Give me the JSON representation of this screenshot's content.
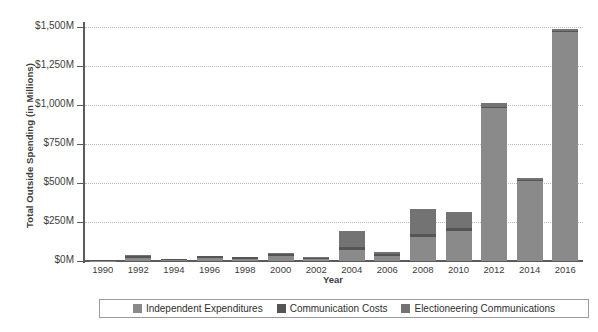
{
  "chart_data": {
    "type": "bar",
    "title": "",
    "xlabel": "Year",
    "ylabel": "Total Outside Spending (in Millions)",
    "ylim": [
      0,
      1500
    ],
    "ytick_labels": [
      "$0M",
      "$250M",
      "$500M",
      "$750M",
      "$1,000M",
      "$1,250M",
      "$1,500M"
    ],
    "ytick_values": [
      0,
      250,
      500,
      750,
      1000,
      1250,
      1500
    ],
    "grid": true,
    "stacked": true,
    "legend_position": "bottom",
    "categories": [
      "1990",
      "1992",
      "1994",
      "1996",
      "1998",
      "2000",
      "2002",
      "2004",
      "2006",
      "2008",
      "2010",
      "2012",
      "2014",
      "2016"
    ],
    "series": [
      {
        "name": "Independent Expenditures",
        "color": "#8a8a8a",
        "values": [
          3,
          20,
          6,
          18,
          14,
          30,
          13,
          68,
          32,
          152,
          193,
          980,
          510,
          1470
        ]
      },
      {
        "name": "Communication Costs",
        "color": "#555555",
        "values": [
          2,
          13,
          6,
          12,
          9,
          17,
          9,
          22,
          10,
          24,
          20,
          8,
          8,
          6
        ]
      },
      {
        "name": "Electioneering Communications",
        "color": "#737373",
        "values": [
          0,
          5,
          2,
          3,
          2,
          5,
          3,
          102,
          18,
          155,
          102,
          24,
          16,
          14
        ]
      }
    ],
    "totals": [
      5,
      38,
      14,
      33,
      25,
      52,
      25,
      192,
      60,
      331,
      315,
      1012,
      534,
      1490
    ]
  },
  "legend": {
    "items": [
      {
        "label": "Independent Expenditures",
        "color": "#8a8a8a"
      },
      {
        "label": "Communication Costs",
        "color": "#555555"
      },
      {
        "label": "Electioneering Communications",
        "color": "#737373"
      }
    ]
  }
}
